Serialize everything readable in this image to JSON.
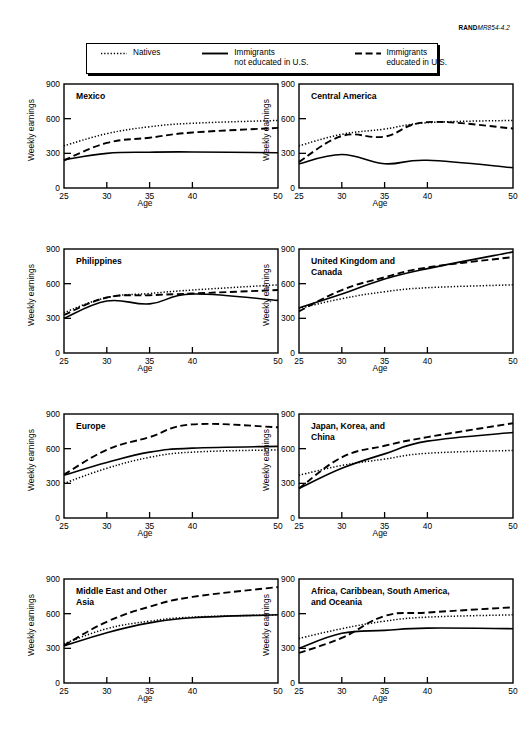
{
  "figure_id": {
    "prefix": "RAND",
    "number": "MR854-4.2"
  },
  "legend": {
    "position": "top",
    "entries": [
      {
        "label_line1": "Natives",
        "label_line2": "",
        "style": "dotted",
        "icon": "dotted-line-swatch"
      },
      {
        "label_line1": "Immigrants",
        "label_line2": "not educated in U.S.",
        "style": "solid",
        "icon": "solid-line-swatch"
      },
      {
        "label_line1": "Immigrants",
        "label_line2": "educated in U.S.",
        "style": "dashed",
        "icon": "dashed-line-swatch"
      }
    ]
  },
  "axes": {
    "xlabel": "Age",
    "ylabel": "Weekly earnings",
    "xticks": [
      25,
      30,
      35,
      40,
      50
    ],
    "yticks": [
      0,
      300,
      600,
      900
    ],
    "xlim": [
      25,
      50
    ],
    "ylim": [
      0,
      900
    ],
    "grid": false
  },
  "chart_data": {
    "type": "line",
    "xlabel": "Age",
    "ylabel": "Weekly earnings",
    "xlim": [
      25,
      50
    ],
    "ylim": [
      0,
      900
    ],
    "xticks": [
      25,
      30,
      35,
      40,
      50
    ],
    "yticks": [
      0,
      300,
      600,
      900
    ],
    "grid": false,
    "legend_position": "top",
    "x": [
      25,
      30,
      35,
      40,
      50
    ],
    "panels": [
      {
        "title": "Mexico",
        "series": [
          {
            "name": "Natives",
            "style": "dotted",
            "values": [
              365,
              470,
              530,
              560,
              585
            ]
          },
          {
            "name": "Immigrants not educated in U.S.",
            "style": "solid",
            "values": [
              245,
              300,
              310,
              312,
              305
            ]
          },
          {
            "name": "Immigrants educated in U.S.",
            "style": "dashed",
            "values": [
              240,
              390,
              435,
              480,
              520
            ]
          }
        ]
      },
      {
        "title": "Central America",
        "series": [
          {
            "name": "Natives",
            "style": "dotted",
            "values": [
              365,
              465,
              510,
              565,
              585
            ]
          },
          {
            "name": "Immigrants not educated in U.S.",
            "style": "solid",
            "values": [
              210,
              290,
              210,
              240,
              175
            ]
          },
          {
            "name": "Immigrants educated in U.S.",
            "style": "dashed",
            "values": [
              225,
              450,
              445,
              570,
              515
            ]
          }
        ]
      },
      {
        "title": "Philippines",
        "series": [
          {
            "name": "Natives",
            "style": "dotted",
            "values": [
              350,
              480,
              515,
              545,
              590
            ]
          },
          {
            "name": "Immigrants not educated in U.S.",
            "style": "solid",
            "values": [
              300,
              450,
              425,
              510,
              455
            ]
          },
          {
            "name": "Immigrants educated in U.S.",
            "style": "dashed",
            "values": [
              330,
              480,
              500,
              515,
              545
            ]
          }
        ]
      },
      {
        "title": "United Kingdom and\nCanada",
        "title_lines": [
          "United Kingdom and",
          "Canada"
        ],
        "series": [
          {
            "name": "Natives",
            "style": "dotted",
            "values": [
              385,
              470,
              530,
              565,
              590
            ]
          },
          {
            "name": "Immigrants not educated in U.S.",
            "style": "solid",
            "values": [
              390,
              510,
              640,
              730,
              875
            ]
          },
          {
            "name": "Immigrants educated in U.S.",
            "style": "dashed",
            "values": [
              360,
              545,
              655,
              740,
              830
            ]
          }
        ]
      },
      {
        "title": "Europe",
        "series": [
          {
            "name": "Natives",
            "style": "dotted",
            "values": [
              300,
              430,
              525,
              570,
              590
            ]
          },
          {
            "name": "Immigrants not educated in U.S.",
            "style": "solid",
            "values": [
              370,
              480,
              570,
              605,
              620
            ]
          },
          {
            "name": "Immigrants educated in U.S.",
            "style": "dashed",
            "values": [
              375,
              590,
              700,
              810,
              785
            ]
          }
        ]
      },
      {
        "title": "Japan, Korea, and\nChina",
        "title_lines": [
          "Japan, Korea, and",
          "China"
        ],
        "series": [
          {
            "name": "Natives",
            "style": "dotted",
            "values": [
              370,
              455,
              510,
              560,
              585
            ]
          },
          {
            "name": "Immigrants not educated in U.S.",
            "style": "solid",
            "values": [
              255,
              430,
              555,
              665,
              740
            ]
          },
          {
            "name": "Immigrants educated in U.S.",
            "style": "dashed",
            "values": [
              255,
              525,
              625,
              700,
              820
            ]
          }
        ]
      },
      {
        "title": "Middle East and Other\nAsia",
        "title_lines": [
          "Middle East and Other",
          "Asia"
        ],
        "series": [
          {
            "name": "Natives",
            "style": "dotted",
            "values": [
              340,
              470,
              535,
              570,
              590
            ]
          },
          {
            "name": "Immigrants not educated in U.S.",
            "style": "solid",
            "values": [
              320,
              435,
              520,
              565,
              590
            ]
          },
          {
            "name": "Immigrants educated in U.S.",
            "style": "dashed",
            "values": [
              325,
              530,
              660,
              745,
              830
            ]
          }
        ]
      },
      {
        "title": "Africa, Caribbean, South America,\nand Oceania",
        "title_lines": [
          "Africa, Caribbean, South America,",
          "and Oceania"
        ],
        "series": [
          {
            "name": "Natives",
            "style": "dotted",
            "values": [
              385,
              470,
              535,
              570,
              590
            ]
          },
          {
            "name": "Immigrants not educated in U.S.",
            "style": "solid",
            "values": [
              300,
              430,
              455,
              475,
              470
            ]
          },
          {
            "name": "Immigrants educated in U.S.",
            "style": "dashed",
            "values": [
              260,
              390,
              580,
              610,
              655
            ]
          }
        ]
      }
    ]
  },
  "colors": {
    "ink": "#000000",
    "background": "#ffffff"
  }
}
